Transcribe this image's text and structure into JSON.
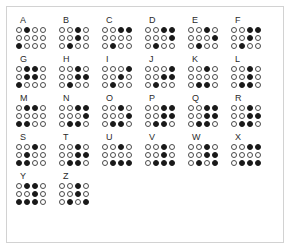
{
  "chart": {
    "cell_columns": 4,
    "cell_rows": 3,
    "filled_color": "#1a1a1a",
    "empty_color": "#ffffff",
    "outline_color": "#3a3a3a",
    "frame_color": "#d2d2d2",
    "background_color": "#ffffff"
  },
  "rows": [
    {
      "letters": [
        {
          "label": "A",
          "dots": [
            [
              0,
              1,
              0,
              0
            ],
            [
              0,
              0,
              0,
              0
            ],
            [
              1,
              0,
              0,
              0
            ]
          ]
        },
        {
          "label": "B",
          "dots": [
            [
              0,
              0,
              1,
              0
            ],
            [
              0,
              0,
              1,
              0
            ],
            [
              0,
              1,
              0,
              0
            ]
          ]
        },
        {
          "label": "C",
          "dots": [
            [
              0,
              0,
              1,
              1
            ],
            [
              0,
              0,
              0,
              0
            ],
            [
              0,
              1,
              0,
              0
            ]
          ]
        },
        {
          "label": "D",
          "dots": [
            [
              0,
              0,
              1,
              1
            ],
            [
              0,
              0,
              0,
              1
            ],
            [
              0,
              1,
              0,
              0
            ]
          ]
        },
        {
          "label": "E",
          "dots": [
            [
              0,
              0,
              1,
              0
            ],
            [
              0,
              0,
              0,
              1
            ],
            [
              0,
              1,
              0,
              0
            ]
          ]
        },
        {
          "label": "F",
          "dots": [
            [
              0,
              0,
              1,
              1
            ],
            [
              0,
              0,
              1,
              0
            ],
            [
              0,
              1,
              0,
              0
            ]
          ]
        }
      ]
    },
    {
      "letters": [
        {
          "label": "G",
          "dots": [
            [
              0,
              1,
              1,
              0
            ],
            [
              0,
              1,
              1,
              0
            ],
            [
              1,
              0,
              0,
              0
            ]
          ]
        },
        {
          "label": "H",
          "dots": [
            [
              0,
              0,
              1,
              0
            ],
            [
              0,
              0,
              1,
              1
            ],
            [
              0,
              1,
              0,
              0
            ]
          ]
        },
        {
          "label": "I",
          "dots": [
            [
              0,
              0,
              0,
              1
            ],
            [
              0,
              0,
              1,
              0
            ],
            [
              0,
              1,
              0,
              0
            ]
          ]
        },
        {
          "label": "J",
          "dots": [
            [
              0,
              0,
              0,
              1
            ],
            [
              0,
              0,
              1,
              1
            ],
            [
              0,
              1,
              0,
              0
            ]
          ]
        },
        {
          "label": "K",
          "dots": [
            [
              0,
              0,
              1,
              0
            ],
            [
              0,
              0,
              0,
              0
            ],
            [
              0,
              1,
              1,
              0
            ]
          ]
        },
        {
          "label": "L",
          "dots": [
            [
              0,
              0,
              1,
              0
            ],
            [
              0,
              0,
              1,
              0
            ],
            [
              0,
              1,
              1,
              0
            ]
          ]
        }
      ]
    },
    {
      "letters": [
        {
          "label": "M",
          "dots": [
            [
              0,
              1,
              1,
              0
            ],
            [
              0,
              0,
              0,
              0
            ],
            [
              1,
              1,
              0,
              0
            ]
          ]
        },
        {
          "label": "N",
          "dots": [
            [
              0,
              0,
              1,
              1
            ],
            [
              0,
              0,
              0,
              1
            ],
            [
              0,
              1,
              1,
              0
            ]
          ]
        },
        {
          "label": "O",
          "dots": [
            [
              0,
              0,
              1,
              0
            ],
            [
              0,
              0,
              0,
              1
            ],
            [
              0,
              1,
              1,
              0
            ]
          ]
        },
        {
          "label": "P",
          "dots": [
            [
              0,
              0,
              1,
              1
            ],
            [
              0,
              0,
              1,
              1
            ],
            [
              0,
              1,
              1,
              0
            ]
          ]
        },
        {
          "label": "Q",
          "dots": [
            [
              0,
              0,
              1,
              1
            ],
            [
              0,
              0,
              1,
              1
            ],
            [
              0,
              1,
              1,
              0
            ]
          ]
        },
        {
          "label": "R",
          "dots": [
            [
              0,
              0,
              1,
              0
            ],
            [
              0,
              0,
              1,
              1
            ],
            [
              0,
              1,
              1,
              0
            ]
          ]
        }
      ]
    },
    {
      "letters": [
        {
          "label": "S",
          "dots": [
            [
              0,
              0,
              1,
              0
            ],
            [
              0,
              1,
              0,
              0
            ],
            [
              1,
              1,
              0,
              0
            ]
          ]
        },
        {
          "label": "T",
          "dots": [
            [
              0,
              0,
              1,
              0
            ],
            [
              0,
              0,
              1,
              1
            ],
            [
              0,
              1,
              1,
              0
            ]
          ]
        },
        {
          "label": "U",
          "dots": [
            [
              0,
              0,
              1,
              0
            ],
            [
              0,
              0,
              0,
              0
            ],
            [
              0,
              1,
              1,
              1
            ]
          ]
        },
        {
          "label": "V",
          "dots": [
            [
              0,
              0,
              1,
              0
            ],
            [
              0,
              0,
              1,
              0
            ],
            [
              0,
              1,
              1,
              1
            ]
          ]
        },
        {
          "label": "W",
          "dots": [
            [
              0,
              0,
              1,
              0
            ],
            [
              0,
              0,
              1,
              1
            ],
            [
              0,
              1,
              0,
              1
            ]
          ]
        },
        {
          "label": "X",
          "dots": [
            [
              0,
              0,
              1,
              1
            ],
            [
              0,
              0,
              0,
              0
            ],
            [
              0,
              1,
              1,
              1
            ]
          ]
        }
      ]
    },
    {
      "letters": [
        {
          "label": "Y",
          "dots": [
            [
              0,
              1,
              1,
              0
            ],
            [
              0,
              0,
              1,
              0
            ],
            [
              1,
              1,
              1,
              0
            ]
          ]
        },
        {
          "label": "Z",
          "dots": [
            [
              0,
              0,
              1,
              0
            ],
            [
              0,
              0,
              1,
              0
            ],
            [
              0,
              1,
              0,
              1
            ]
          ]
        }
      ]
    }
  ]
}
